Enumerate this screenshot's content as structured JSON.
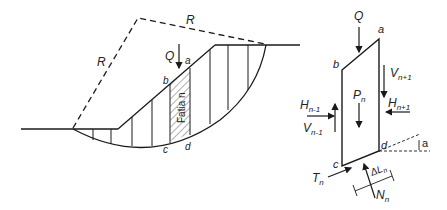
{
  "figure": {
    "left_diagram": {
      "radius_label_1": "R",
      "radius_label_2": "R",
      "load_label": "Q",
      "point_a": "a",
      "point_b": "b",
      "point_c": "c",
      "point_d": "d",
      "slice_label": "Fatia n"
    },
    "right_diagram": {
      "load_label": "Q",
      "point_a": "a",
      "point_b": "b",
      "point_c": "c",
      "point_d": "d",
      "weight_label": "P",
      "weight_sub": "n",
      "v_right": "V",
      "v_right_sub": "n+1",
      "h_right": "H",
      "h_right_sub": "n+1",
      "h_left": "H",
      "h_left_sub": "n-1",
      "v_left": "V",
      "v_left_sub": "n-1",
      "shear": "T",
      "shear_sub": "n",
      "normal": "N",
      "normal_sub": "n",
      "length": "ΔL",
      "length_sub": "n",
      "angle": "a"
    },
    "colors": {
      "line": "#1a1a1a",
      "background": "#ffffff"
    }
  }
}
